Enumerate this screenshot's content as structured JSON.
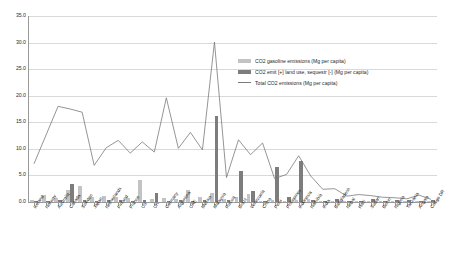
{
  "chart_data": {
    "type": "bar",
    "title": "",
    "xlabel": "",
    "ylabel": "",
    "ylim": [
      0,
      35
    ],
    "ytick_step": 5,
    "grid": true,
    "legend_position": "upper-right",
    "ytick_labels": [
      "35.0",
      "30.0",
      "25.0",
      "20.0",
      "15.0",
      "10.0",
      "5.0",
      "0.0"
    ],
    "categories": [
      "Iceland",
      "Norway",
      "Australia",
      "Canada",
      "Sweden",
      "Japan",
      "Netherlands",
      "Finland",
      "France",
      "US",
      "UK",
      "Germany",
      "Argentina",
      "UAE",
      "Mexico",
      "Malaysia",
      "Russia",
      "Brazil",
      "Venezuela",
      "China",
      "Peru",
      "Philippines",
      "Indonesia",
      "Namibia",
      "India",
      "Bangladesh",
      "Nepal",
      "Haiti",
      "Sudan",
      "Benin",
      "Nigeria",
      "Tanzania",
      "Angola",
      "Congo DR"
    ],
    "series": [
      {
        "name": "CO2 gasoline emissions (Mg per capita)",
        "color": "#c3c3c3",
        "type": "bar",
        "values": [
          0.4,
          1.3,
          0.7,
          2.3,
          3.1,
          1.0,
          1.2,
          1.0,
          0.7,
          4.2,
          0.5,
          0.7,
          0.6,
          2.2,
          0.9,
          1.7,
          0.5,
          0.9,
          1.5,
          0.2,
          0.3,
          0.2,
          0.3,
          0.5,
          0.2,
          0.1,
          0.1,
          0.1,
          0.1,
          0.1,
          0.1,
          0.1,
          0.2,
          0.1
        ]
      },
      {
        "name": "CO2 emit [+] land use, sequestr [-]  (Mg per capita)",
        "color": "#7d7d7d",
        "type": "bar",
        "values": [
          0.1,
          0.2,
          0.3,
          3.4,
          0.4,
          0.2,
          0.3,
          0.4,
          0.2,
          0.4,
          1.7,
          0.2,
          0.4,
          0.1,
          0.3,
          16.2,
          0.4,
          5.8,
          2.0,
          0.2,
          6.6,
          1.0,
          7.7,
          0.3,
          0.1,
          0.6,
          0.2,
          0.2,
          0.6,
          0.2,
          0.3,
          0.4,
          0.2,
          0.4
        ]
      },
      {
        "name": "Total CO2 emissions (Mg per capita)",
        "color": "#7a7a7a",
        "type": "line",
        "values": [
          7.2,
          12.6,
          18.0,
          17.5,
          16.9,
          6.9,
          10.2,
          11.6,
          9.2,
          11.3,
          9.4,
          19.6,
          10.1,
          13.1,
          9.8,
          30.1,
          4.6,
          11.7,
          8.9,
          11.1,
          4.4,
          5.2,
          8.7,
          4.9,
          2.4,
          2.5,
          1.1,
          1.4,
          1.2,
          0.9,
          0.8,
          0.6,
          1.3,
          0.5
        ]
      }
    ]
  },
  "legend": {
    "items": [
      {
        "label": "CO2 gasoline emissions (Mg per capita)",
        "marker": "gasoline"
      },
      {
        "label": "CO2 emit [+] land use, sequestr [-]  (Mg per capita)",
        "marker": "landuse"
      },
      {
        "label": "Total CO2 emissions (Mg per capita)",
        "marker": "line"
      }
    ]
  }
}
